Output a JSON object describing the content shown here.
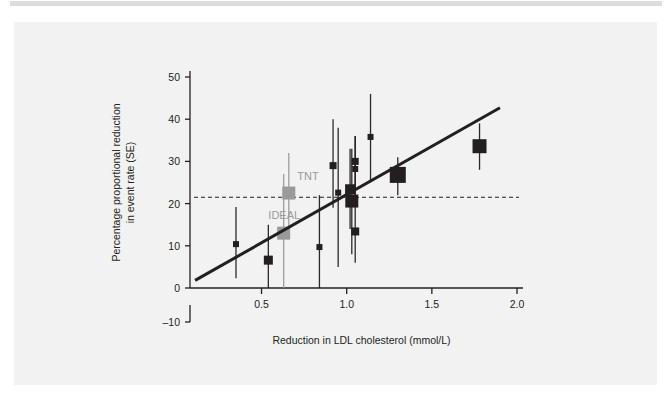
{
  "figure": {
    "background_color": "#f2f2f2",
    "page_color": "#ffffff",
    "top_strip_color": "#dcdcdc"
  },
  "chart_data": {
    "type": "scatter",
    "title": "",
    "subtitle": "",
    "xlabel": "Reduction in LDL cholesterol (mmol/L)",
    "ylabel": "Percentage proportional reduction\nin event rate (SE)",
    "ylabel_line1": "Percentage proportional reduction",
    "ylabel_line2": "in event rate (SE)",
    "xlim": [
      0.08,
      2.0
    ],
    "ylim": [
      -10,
      50
    ],
    "xticks": [
      0.5,
      1.0,
      1.5,
      2.0
    ],
    "xtick_labels": [
      "0.5",
      "1.0",
      "1.5",
      "2.0"
    ],
    "yticks": [
      -10,
      0,
      10,
      20,
      30,
      40,
      50
    ],
    "ytick_labels": [
      "-10",
      "0",
      "10",
      "20",
      "30",
      "40",
      "50"
    ],
    "grid": false,
    "legend": "none",
    "axis_break": {
      "present": true,
      "between": [
        -10,
        0
      ],
      "note": "y axis is drawn broken between -10 and 0"
    },
    "marker_shape": "square",
    "marker_note": "square size is proportional to trial weight; vertical whiskers are 95% confidence intervals",
    "series": [
      {
        "name": "Statin trials",
        "color": "#231f20",
        "points": [
          {
            "label": "",
            "x": 0.35,
            "y": 10.4,
            "ci_low": 2.3,
            "ci_high": 19.2,
            "size": 6
          },
          {
            "label": "",
            "x": 0.54,
            "y": 6.6,
            "ci_low": -2.0,
            "ci_high": 15.0,
            "size": 9
          },
          {
            "label": "",
            "x": 0.84,
            "y": 9.7,
            "ci_low": -3.0,
            "ci_high": 22.0,
            "size": 6
          },
          {
            "label": "",
            "x": 0.92,
            "y": 29.0,
            "ci_low": 19.0,
            "ci_high": 40.0,
            "size": 7
          },
          {
            "label": "",
            "x": 0.95,
            "y": 22.6,
            "ci_low": 5.0,
            "ci_high": 38.0,
            "size": 6
          },
          {
            "label": "",
            "x": 1.02,
            "y": 23.4,
            "ci_low": 14.0,
            "ci_high": 33.0,
            "size": 10
          },
          {
            "label": "",
            "x": 1.03,
            "y": 20.6,
            "ci_low": 8.0,
            "ci_high": 33.0,
            "size": 13
          },
          {
            "label": "",
            "x": 1.05,
            "y": 30.0,
            "ci_low": 22.0,
            "ci_high": 36.0,
            "size": 7
          },
          {
            "label": "",
            "x": 1.05,
            "y": 28.2,
            "ci_low": 22.0,
            "ci_high": 36.0,
            "size": 6
          },
          {
            "label": "",
            "x": 1.05,
            "y": 13.4,
            "ci_low": 6.0,
            "ci_high": 21.0,
            "size": 8
          },
          {
            "label": "",
            "x": 1.14,
            "y": 35.8,
            "ci_low": 25.0,
            "ci_high": 46.0,
            "size": 6
          },
          {
            "label": "",
            "x": 1.3,
            "y": 26.8,
            "ci_low": 22.0,
            "ci_high": 31.0,
            "size": 16
          },
          {
            "label": "",
            "x": 1.78,
            "y": 33.6,
            "ci_low": 28.0,
            "ci_high": 39.0,
            "size": 14
          }
        ]
      },
      {
        "name": "Intensive statin trials",
        "color": "#9a9a9a",
        "points": [
          {
            "label": "TNT",
            "x": 0.66,
            "y": 22.5,
            "ci_low": 12.0,
            "ci_high": 32.0,
            "size": 13
          },
          {
            "label": "IDEAL",
            "x": 0.63,
            "y": 13.0,
            "ci_low": -1.5,
            "ci_high": 27.0,
            "size": 13
          }
        ]
      }
    ],
    "annotations": [
      {
        "text": "TNT",
        "x": 0.71,
        "y": 25.5,
        "color": "#9a9a9a"
      },
      {
        "text": "IDEAL",
        "x": 0.54,
        "y": 16.3,
        "color": "#9a9a9a"
      }
    ],
    "reference_line": {
      "type": "horizontal-dashed",
      "y": 21.5,
      "color": "#231f20",
      "label": ""
    },
    "fit_line": {
      "type": "linear-regression",
      "color": "#231f20",
      "x_start": 0.11,
      "y_start": 1.8,
      "x_end": 1.9,
      "y_end": 42.7
    }
  }
}
